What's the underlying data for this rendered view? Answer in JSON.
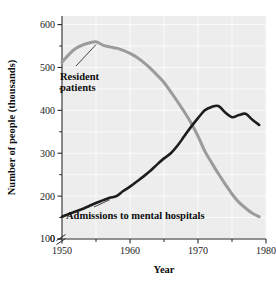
{
  "chart_data": {
    "type": "line",
    "title": "",
    "xlabel": "Year",
    "ylabel": "Number of people (thousands)",
    "xlim": [
      1950,
      1980
    ],
    "ylim": [
      100,
      620
    ],
    "y_axis_break": true,
    "y_axis_break_note": "axis broken between 0 and 100",
    "grid": true,
    "legend_position": "inline-annotations",
    "xticks": [
      1950,
      1960,
      1970,
      1980
    ],
    "xtick_labels": [
      "1950",
      "1960",
      "1970",
      "1980"
    ],
    "xminor_ticks": [
      1955,
      1965,
      1975
    ],
    "yticks": [
      0,
      100,
      200,
      300,
      400,
      500,
      600
    ],
    "ytick_labels": [
      "0",
      "100",
      "200",
      "300",
      "400",
      "500",
      "600"
    ],
    "yminor_ticks": [
      150,
      250,
      350,
      450,
      550
    ],
    "series": [
      {
        "name": "Resident patients",
        "color": "#9b9b9b",
        "x": [
          1950,
          1951,
          1952,
          1953,
          1954,
          1955,
          1956,
          1957,
          1958,
          1959,
          1960,
          1961,
          1962,
          1963,
          1964,
          1965,
          1966,
          1967,
          1968,
          1969,
          1970,
          1971,
          1972,
          1973,
          1974,
          1975,
          1976,
          1977,
          1978,
          1979
        ],
        "values": [
          512,
          530,
          544,
          552,
          557,
          560,
          552,
          548,
          545,
          540,
          533,
          524,
          512,
          498,
          482,
          465,
          443,
          420,
          396,
          370,
          340,
          305,
          278,
          252,
          228,
          205,
          186,
          172,
          160,
          152
        ]
      },
      {
        "name": "Admissions to mental hospitals",
        "color": "#1d1d1d",
        "x": [
          1950,
          1951,
          1952,
          1953,
          1954,
          1955,
          1956,
          1957,
          1958,
          1959,
          1960,
          1961,
          1962,
          1963,
          1964,
          1965,
          1966,
          1967,
          1968,
          1969,
          1970,
          1971,
          1972,
          1973,
          1974,
          1975,
          1976,
          1977,
          1978,
          1979
        ],
        "values": [
          152,
          158,
          164,
          170,
          177,
          184,
          190,
          196,
          200,
          212,
          222,
          234,
          246,
          259,
          274,
          288,
          300,
          318,
          340,
          362,
          382,
          400,
          408,
          410,
          395,
          384,
          389,
          392,
          378,
          366
        ]
      }
    ],
    "annotations": [
      {
        "text_line_1": "Resident",
        "text_line_2": "patients",
        "target_year": 1955,
        "target_value": 558
      },
      {
        "text_line_1": "Admissions to mental hospitals",
        "text_line_2": "",
        "target_year": 1957,
        "target_value": 196
      }
    ]
  },
  "colors": {
    "plot_background": "#ededed",
    "gridline": "#fbfbfb",
    "axis": "#2b2b2b",
    "resident_patients": "#9b9b9b",
    "admissions": "#1d1d1d",
    "page_background": "#ffffff"
  },
  "axis_labels": {
    "y_title": "Number of people (thousands)",
    "x_title": "Year"
  }
}
